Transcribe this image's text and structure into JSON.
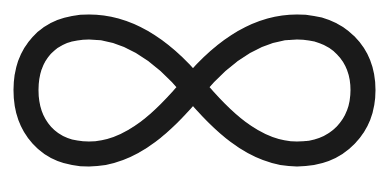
{
  "canvas": {
    "background_color": "#ffffff",
    "width": "389",
    "height": "189"
  },
  "symbol": {
    "name": "infinity-symbol",
    "unicode": "∞",
    "color": "#1a1a1a",
    "aria_label": "infinity symbol"
  }
}
